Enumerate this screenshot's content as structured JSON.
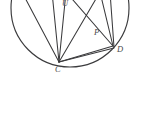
{
  "figure": {
    "kind": "geometry-diagram",
    "background_color": "#ffffff",
    "ink_color": "#3a3a3c",
    "label_color": "#4a4a4c",
    "canvas": {
      "width": 141,
      "height": 119
    },
    "circle": {
      "center_x": 70,
      "center_y": 8,
      "radius": 59,
      "stroke_color": "#3a3a3c",
      "stroke_width": 1.15
    },
    "points": [
      {
        "id": "top",
        "label": "U",
        "x": 66,
        "y": -2,
        "label_x": 62,
        "label_y": -1,
        "clipped": true
      },
      {
        "id": "P",
        "label": "P",
        "x": 92,
        "y": 30,
        "label_x": 94,
        "label_y": 28,
        "clipped": false
      },
      {
        "id": "D",
        "label": "D",
        "x": 113,
        "y": 46,
        "label_x": 117,
        "label_y": 45,
        "clipped": false
      },
      {
        "id": "C",
        "label": "C",
        "x": 59,
        "y": 62,
        "label_x": 55,
        "label_y": 65,
        "clipped": false
      }
    ],
    "segments": [
      {
        "id": "c-to-upper-left",
        "from": [
          59,
          62
        ],
        "to": [
          23,
          -6
        ]
      },
      {
        "id": "c-to-top-left",
        "from": [
          59,
          62
        ],
        "to": [
          52,
          -8
        ]
      },
      {
        "id": "c-to-top",
        "from": [
          59,
          62
        ],
        "to": [
          66,
          -8
        ]
      },
      {
        "id": "c-to-upper-right",
        "from": [
          59,
          62
        ],
        "to": [
          100,
          -8
        ]
      },
      {
        "id": "c-to-p-d",
        "from": [
          59,
          62
        ],
        "to": [
          113,
          46
        ]
      },
      {
        "id": "c-to-d-lower",
        "from": [
          59,
          62
        ],
        "to": [
          114,
          48
        ]
      },
      {
        "id": "top-to-d",
        "from": [
          66,
          -8
        ],
        "to": [
          113,
          46
        ]
      },
      {
        "id": "upper-right-to-d",
        "from": [
          100,
          -8
        ],
        "to": [
          113,
          46
        ]
      },
      {
        "id": "right-arc-chord",
        "from": [
          110,
          -8
        ],
        "to": [
          114,
          47
        ]
      }
    ]
  }
}
